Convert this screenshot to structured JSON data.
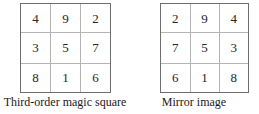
{
  "figure": {
    "background_color": "#ffffff",
    "grid_border_color": "#6e6e6e",
    "grid_line_color": "#b4b4b4",
    "digit_color": "#262626",
    "caption_color": "#1a1a1a"
  },
  "panels": [
    {
      "id": "third-order-magic-square",
      "caption": "Third-order magic square",
      "rows": [
        [
          "4",
          "9",
          "2"
        ],
        [
          "3",
          "5",
          "7"
        ],
        [
          "8",
          "1",
          "6"
        ]
      ]
    },
    {
      "id": "mirror-image",
      "caption": "Mirror image",
      "rows": [
        [
          "2",
          "9",
          "4"
        ],
        [
          "7",
          "5",
          "3"
        ],
        [
          "6",
          "1",
          "8"
        ]
      ]
    }
  ],
  "chart_data": {
    "type": "table",
    "title": "",
    "panels": [
      {
        "title": "Third-order magic square",
        "values": [
          [
            4,
            9,
            2
          ],
          [
            3,
            5,
            7
          ],
          [
            8,
            1,
            6
          ]
        ],
        "magic_constant": 15
      },
      {
        "title": "Mirror image",
        "values": [
          [
            2,
            9,
            4
          ],
          [
            7,
            5,
            3
          ],
          [
            6,
            1,
            8
          ]
        ],
        "magic_constant": 15
      }
    ]
  }
}
